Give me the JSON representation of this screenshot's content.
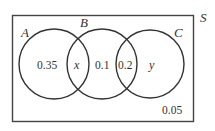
{
  "diagram": {
    "type": "venn",
    "universe_label": "S",
    "sets": [
      {
        "label": "A"
      },
      {
        "label": "B"
      },
      {
        "label": "C"
      }
    ],
    "regions": {
      "a_only": "0.35",
      "a_and_b": "x",
      "b_only": "0.1",
      "b_and_c": "0.2",
      "c_only": "y",
      "outside": "0.05"
    },
    "colors": {
      "stroke": "#333333",
      "background": "#ffffff"
    }
  }
}
